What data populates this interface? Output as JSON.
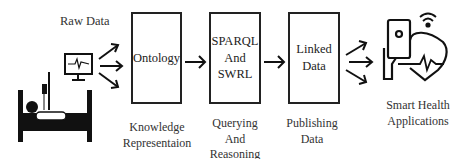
{
  "labels": {
    "raw_data": "Raw Data",
    "smart_health": "Smart Health\nApplications"
  },
  "stages": [
    {
      "box": "Ontology",
      "caption": "Knowledge\nRepresentaion"
    },
    {
      "box": "SPARQL\nAnd\nSWRL",
      "caption": "Querying\nAnd\nReasoning"
    },
    {
      "box": "Linked\nData",
      "caption": "Publishing\nData"
    }
  ],
  "icons": {
    "source": "patient-bed-monitor-icon",
    "destination": "smart-health-device-heart-icon"
  }
}
